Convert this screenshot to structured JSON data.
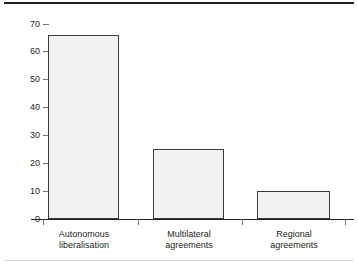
{
  "chart_data": {
    "type": "bar",
    "title": "",
    "subtitle": "",
    "xlabel": "",
    "ylabel": "",
    "categories": [
      "Autonomous liberalisation",
      "Multilateral agreements",
      "Regional agreements"
    ],
    "category_lines": [
      [
        "Autonomous",
        "liberalisation"
      ],
      [
        "Multilateral",
        "agreements"
      ],
      [
        "Regional",
        "agreements"
      ]
    ],
    "values": [
      66,
      25,
      10
    ],
    "ylim": [
      0,
      70
    ],
    "yticks": [
      0,
      10,
      20,
      30,
      40,
      50,
      60,
      70
    ],
    "ytick_labels": [
      "0",
      "10",
      "20",
      "30",
      "40",
      "50",
      "60",
      "70"
    ],
    "grid": false,
    "legend": false,
    "legend_position": "none",
    "bar_fill_color": "#f2f2f2",
    "bar_border_color": "#3b3b3b",
    "axis_color": "#231f20",
    "tick_color": "#6f6f6f",
    "background_color": "#ffffff"
  },
  "figure": {
    "top_rule": "",
    "bottom_rule": ""
  }
}
